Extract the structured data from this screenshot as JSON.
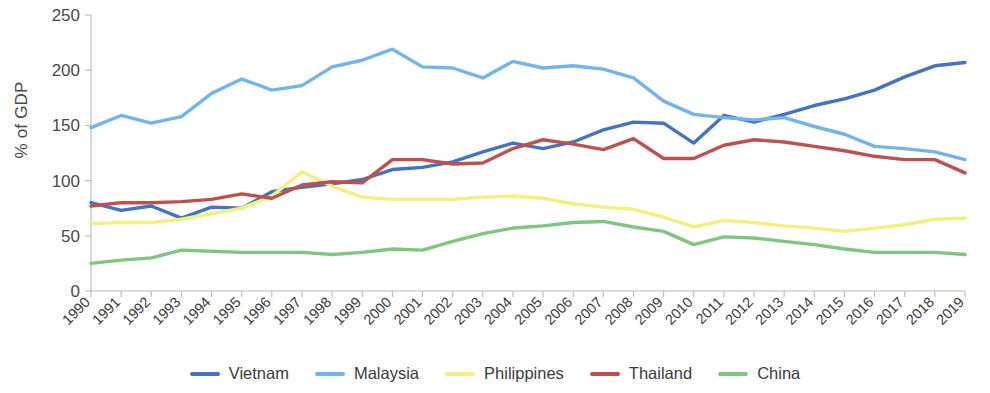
{
  "chart_data": {
    "type": "line",
    "title": "",
    "xlabel": "",
    "ylabel": "% of GDP",
    "ylim": [
      0,
      250
    ],
    "yticks": [
      0,
      50,
      100,
      150,
      200,
      250
    ],
    "grid": false,
    "legend_position": "bottom-center",
    "x": [
      1990,
      1991,
      1992,
      1993,
      1994,
      1995,
      1996,
      1997,
      1998,
      1999,
      2000,
      2001,
      2002,
      2003,
      2004,
      2005,
      2006,
      2007,
      2008,
      2009,
      2010,
      2011,
      2012,
      2013,
      2014,
      2015,
      2016,
      2017,
      2018,
      2019
    ],
    "categories": [
      "1990",
      "1991",
      "1992",
      "1993",
      "1994",
      "1995",
      "1996",
      "1997",
      "1998",
      "1999",
      "2000",
      "2001",
      "2002",
      "2003",
      "2004",
      "2005",
      "2006",
      "2007",
      "2008",
      "2009",
      "2010",
      "2011",
      "2012",
      "2013",
      "2014",
      "2015",
      "2016",
      "2017",
      "2018",
      "2019"
    ],
    "series": [
      {
        "name": "Vietnam",
        "color": "#4472C4",
        "values": [
          80,
          73,
          77,
          66,
          76,
          75,
          90,
          94,
          97,
          101,
          110,
          112,
          117,
          126,
          134,
          129,
          135,
          146,
          153,
          152,
          134,
          159,
          153,
          160,
          168,
          174,
          182,
          194,
          204,
          207
        ]
      },
      {
        "name": "Malaysia",
        "color": "#70B5EC",
        "values": [
          148,
          159,
          152,
          158,
          179,
          192,
          182,
          186,
          203,
          209,
          219,
          203,
          202,
          193,
          208,
          202,
          204,
          201,
          193,
          172,
          160,
          157,
          155,
          157,
          149,
          142,
          131,
          129,
          126,
          119
        ]
      },
      {
        "name": "Philippines",
        "color": "#F5F07A",
        "values": [
          61,
          62,
          62,
          65,
          70,
          75,
          86,
          108,
          95,
          85,
          83,
          83,
          83,
          85,
          86,
          84,
          79,
          76,
          74,
          67,
          58,
          64,
          62,
          59,
          57,
          54,
          57,
          60,
          65,
          66
        ]
      },
      {
        "name": "Thailand",
        "color": "#C0504D",
        "values": [
          77,
          80,
          80,
          81,
          83,
          88,
          84,
          96,
          99,
          98,
          119,
          119,
          115,
          116,
          129,
          137,
          133,
          128,
          138,
          120,
          120,
          132,
          137,
          135,
          131,
          127,
          122,
          119,
          119,
          107
        ]
      },
      {
        "name": "China",
        "color": "#7DC87D",
        "values": [
          25,
          28,
          30,
          37,
          36,
          35,
          35,
          35,
          33,
          35,
          38,
          37,
          45,
          52,
          57,
          59,
          62,
          63,
          58,
          54,
          42,
          49,
          48,
          45,
          42,
          38,
          35,
          35,
          35,
          33
        ]
      }
    ]
  },
  "legend": {
    "items": [
      {
        "label": "Vietnam",
        "color": "#4472C4"
      },
      {
        "label": "Malaysia",
        "color": "#70B5EC"
      },
      {
        "label": "Philippines",
        "color": "#F5F07A"
      },
      {
        "label": "Thailand",
        "color": "#C0504D"
      },
      {
        "label": "China",
        "color": "#7DC87D"
      }
    ]
  }
}
